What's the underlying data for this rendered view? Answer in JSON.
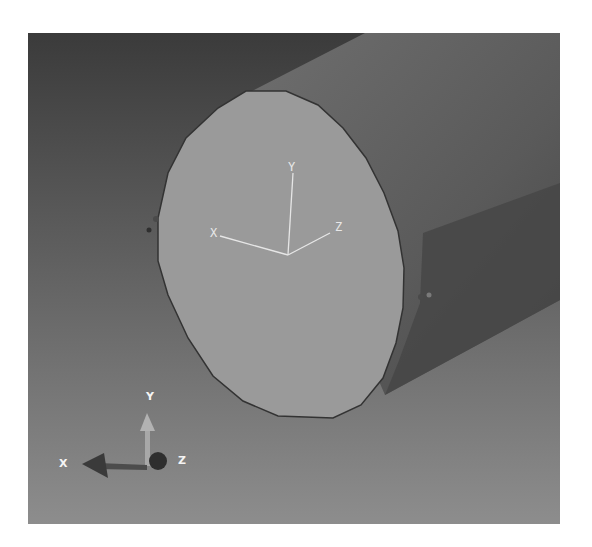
{
  "viewport": {
    "background_top": "#3c3c3c",
    "background_bottom": "#8c8c8c",
    "cylinder_side_color": "#6b6b6b",
    "cylinder_shadow_color": "#464646",
    "end_cap_color": "#9b9b9b",
    "outline_color": "#333333"
  },
  "local_axes": {
    "x_label": "X",
    "y_label": "Y",
    "z_label": "Z",
    "color": "#e6e6e6"
  },
  "view_triad": {
    "x_label": "X",
    "y_label": "Y",
    "z_label": "Z"
  }
}
